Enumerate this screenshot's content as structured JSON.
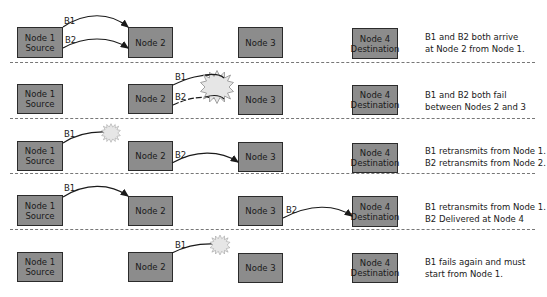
{
  "nodes": {
    "n1": {
      "line1": "Node 1",
      "line2": "Source"
    },
    "n2": {
      "line1": "Node 2"
    },
    "n3": {
      "line1": "Node 3"
    },
    "n4": {
      "line1": "Node 4",
      "line2": "Destination"
    }
  },
  "packets": {
    "b1": "B1",
    "b2": "B2"
  },
  "rows": [
    {
      "caption_line1": "B1 and B2 both arrive",
      "caption_line2": "at Node 2 from Node 1."
    },
    {
      "caption_line1": "B1 and B2 both fail",
      "caption_line2": "between Nodes 2 and 3"
    },
    {
      "caption_line1": "B1 retransmits from Node 1.",
      "caption_line2": "B2 retransmits from Node 2."
    },
    {
      "caption_line1": "B1 retransmits from Node 1.",
      "caption_line2": "B2 Delivered at Node 4"
    },
    {
      "caption_line1": "B1 fails again and must",
      "caption_line2": "start from Node 1."
    }
  ],
  "colors": {
    "node_fill": "#8c8c8c",
    "node_border": "#2b2b2b",
    "burst_fill": "#e6e6e6"
  }
}
